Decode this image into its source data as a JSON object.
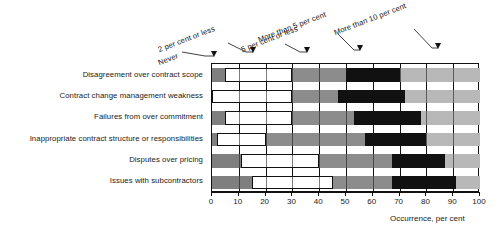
{
  "chart_data": {
    "type": "bar",
    "orientation": "horizontal",
    "stacked": true,
    "title": "",
    "subtitle": "",
    "xlabel": "Occurrence, per cent",
    "ylabel": "",
    "xlim": [
      0,
      100
    ],
    "xticks": [
      0,
      10,
      20,
      30,
      40,
      50,
      60,
      70,
      80,
      90,
      100
    ],
    "xticklabels": [
      "0",
      "10",
      "20",
      "30",
      "40",
      "50",
      "60",
      "70",
      "80",
      "90",
      "100"
    ],
    "grid": true,
    "legend": "annotated-arrows-top",
    "categories": [
      "Disagreement over contract scope",
      "Contract change management weakness",
      "Failures from over commitment",
      "Inappropriate contract structure or responsibilities",
      "Disputes over pricing",
      "Issues with subcontractors"
    ],
    "series": [
      {
        "name": "Never",
        "color": "#7f7f7f",
        "values": [
          5,
          0,
          5,
          2,
          11,
          15
        ]
      },
      {
        "name": "2 per cent or less",
        "color": "#ffffff",
        "values": [
          25,
          30,
          25,
          18,
          29,
          30
        ]
      },
      {
        "name": "5 per cent or less",
        "color": "#8c8c8c",
        "values": [
          20,
          17,
          23,
          37,
          27,
          22
        ]
      },
      {
        "name": "More than 5 per cent",
        "color": "#111111",
        "values": [
          20,
          25,
          25,
          23,
          20,
          24
        ]
      },
      {
        "name": "More than 10 per cent",
        "color": "#b8b8b8",
        "values": [
          30,
          28,
          22,
          20,
          13,
          9
        ]
      }
    ],
    "annotations": [
      {
        "label": "Never",
        "arrow_to_percent": 1.0,
        "label_x": 162,
        "label_y": 52
      },
      {
        "label": "2 per cent or less",
        "arrow_to_percent": 16.0,
        "label_x": 162,
        "label_y": 40
      },
      {
        "label": "5 per cent or less",
        "arrow_to_percent": 36.0,
        "label_x": 246,
        "label_y": 40
      },
      {
        "label": "More than 5 per cent",
        "arrow_to_percent": 56.0,
        "label_x": 262,
        "label_y": 30
      },
      {
        "label": "More than 10 per cent",
        "arrow_to_percent": 85.0,
        "label_x": 338,
        "label_y": 25
      }
    ]
  }
}
